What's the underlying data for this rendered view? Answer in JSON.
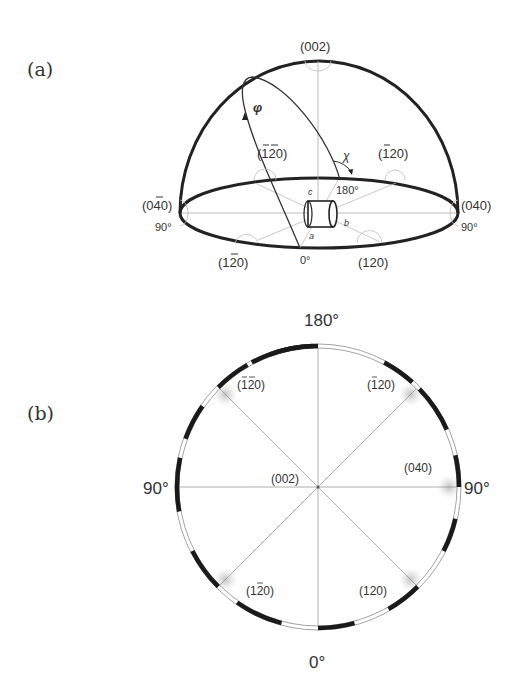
{
  "figure": {
    "panel_a": {
      "label": "(a)",
      "planes": {
        "top": "(002)",
        "back_left": "(̅1̅2 0)",
        "back_right": "(̅1 2 0)",
        "left": "(0̅4 0)",
        "right": "(040)",
        "front_left": "(1̅2 0)",
        "front_right": "(120)"
      },
      "plane_labels_plain": {
        "top": "(002)",
        "back_left": "(-1-20)",
        "back_right": "(-120)",
        "left": "(0-40)",
        "right": "(040)",
        "front_left": "(1-20)",
        "front_right": "(120)"
      },
      "angles": {
        "left": "90°",
        "right": "90°",
        "front": "0°",
        "back": "180°"
      },
      "symbols": {
        "phi": "φ",
        "chi": "χ"
      },
      "crystal_axes": {
        "a": "a",
        "b": "b",
        "c": "c"
      }
    },
    "panel_b": {
      "label": "(b)",
      "angles": {
        "top": "180°",
        "left": "90°",
        "right": "90°",
        "bottom": "0°"
      },
      "planes": {
        "center": "(002)",
        "upper_left": "(-1-20)",
        "upper_right": "(-120)",
        "right": "(040)",
        "lower_left": "(1-20)",
        "lower_right": "(120)"
      },
      "ring_black_segments_deg": [
        [
          -28,
          0
        ],
        [
          28,
          42
        ],
        [
          46,
          66
        ],
        [
          77,
          90
        ],
        [
          103,
          117
        ],
        [
          135,
          150
        ],
        [
          165,
          180
        ],
        [
          195,
          215
        ],
        [
          225,
          243
        ],
        [
          260,
          282
        ],
        [
          290,
          305
        ],
        [
          315,
          330
        ],
        [
          340,
          358
        ]
      ],
      "spots_deg": [
        45,
        90,
        135,
        225,
        315
      ]
    }
  }
}
